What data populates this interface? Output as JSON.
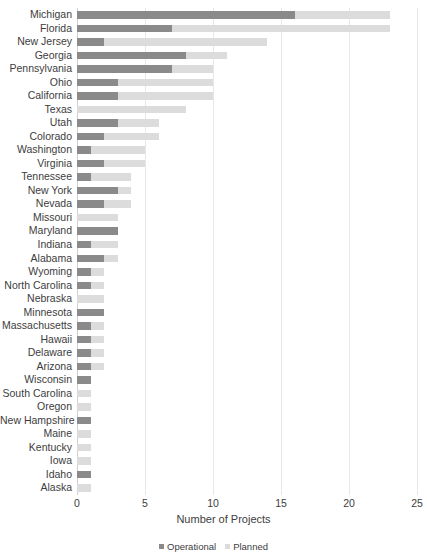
{
  "chart_data": {
    "type": "bar",
    "orientation": "horizontal",
    "stacked": true,
    "title": "",
    "xlabel": "Number of Projects",
    "ylabel": "",
    "xlim": [
      0,
      25
    ],
    "xticks": [
      0,
      5,
      10,
      15,
      20,
      25
    ],
    "grid": true,
    "legend_position": "bottom",
    "colors": {
      "operational": "#8a8a8a",
      "planned": "#dcdcdc",
      "gridline": "#e8e8e8",
      "text": "#3d3d3d",
      "background": "#ffffff"
    },
    "categories": [
      "Michigan",
      "Florida",
      "New Jersey",
      "Georgia",
      "Pennsylvania",
      "Ohio",
      "California",
      "Texas",
      "Utah",
      "Colorado",
      "Washington",
      "Virginia",
      "Tennessee",
      "New York",
      "Nevada",
      "Missouri",
      "Maryland",
      "Indiana",
      "Alabama",
      "Wyoming",
      "North Carolina",
      "Nebraska",
      "Minnesota",
      "Massachusetts",
      "Hawaii",
      "Delaware",
      "Arizona",
      "Wisconsin",
      "South Carolina",
      "Oregon",
      "New Hampshire",
      "Maine",
      "Kentucky",
      "Iowa",
      "Idaho",
      "Alaska"
    ],
    "series": [
      {
        "name": "Operational",
        "color": "#8a8a8a",
        "values": [
          16,
          7,
          2,
          8,
          7,
          3,
          3,
          0,
          3,
          2,
          1,
          2,
          1,
          3,
          2,
          0,
          3,
          1,
          2,
          1,
          1,
          0,
          2,
          1,
          1,
          1,
          1,
          1,
          0,
          0,
          1,
          0,
          0,
          0,
          1,
          0
        ]
      },
      {
        "name": "Planned",
        "color": "#dcdcdc",
        "values": [
          7,
          16,
          12,
          3,
          3,
          7,
          7,
          8,
          3,
          4,
          4,
          3,
          3,
          1,
          2,
          3,
          0,
          2,
          1,
          1,
          1,
          2,
          0,
          1,
          1,
          1,
          1,
          0,
          1,
          1,
          0,
          1,
          1,
          1,
          0,
          1
        ]
      }
    ],
    "totals": [
      23,
      23,
      14,
      11,
      10,
      10,
      10,
      8,
      6,
      6,
      5,
      5,
      4,
      4,
      4,
      3,
      3,
      3,
      3,
      2,
      2,
      2,
      2,
      2,
      2,
      2,
      2,
      1,
      1,
      1,
      1,
      1,
      1,
      1,
      1,
      1
    ]
  },
  "legend": {
    "items": [
      {
        "label": "Operational",
        "swatch": "operational-swatch"
      },
      {
        "label": "Planned",
        "swatch": "planned-swatch"
      }
    ]
  }
}
